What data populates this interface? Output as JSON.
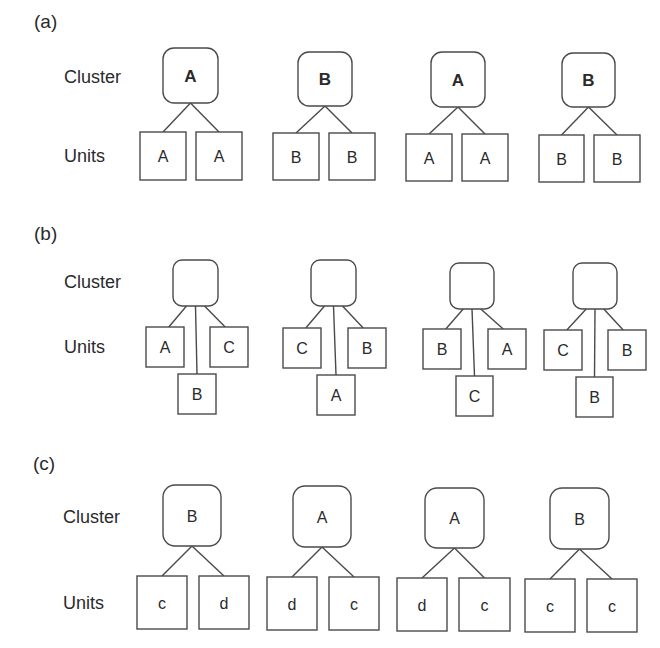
{
  "diagram": {
    "row_labels": {
      "cluster": "Cluster",
      "units": "Units"
    },
    "stroke_color": "#4a4a4a",
    "text_color": "#2a2a2a",
    "panels": [
      {
        "id": "a",
        "label": "(a)",
        "label_pos": [
          34,
          28
        ],
        "cluster_label_pos": [
          64,
          83
        ],
        "units_label_pos": [
          64,
          162
        ],
        "cluster_bold": true,
        "trees": [
          {
            "cluster": {
              "text": "A",
              "x": 163,
              "y": 48,
              "w": 55,
              "h": 55
            },
            "units": [
              {
                "text": "A",
                "x": 140,
                "y": 132,
                "w": 46,
                "h": 48
              },
              {
                "text": "A",
                "x": 196,
                "y": 132,
                "w": 46,
                "h": 48
              }
            ]
          },
          {
            "cluster": {
              "text": "B",
              "x": 298,
              "y": 52,
              "w": 54,
              "h": 54
            },
            "units": [
              {
                "text": "B",
                "x": 273,
                "y": 133,
                "w": 46,
                "h": 47
              },
              {
                "text": "B",
                "x": 329,
                "y": 133,
                "w": 46,
                "h": 47
              }
            ]
          },
          {
            "cluster": {
              "text": "A",
              "x": 431,
              "y": 52,
              "w": 54,
              "h": 55
            },
            "units": [
              {
                "text": "A",
                "x": 406,
                "y": 134,
                "w": 46,
                "h": 47
              },
              {
                "text": "A",
                "x": 462,
                "y": 134,
                "w": 46,
                "h": 47
              }
            ]
          },
          {
            "cluster": {
              "text": "B",
              "x": 562,
              "y": 53,
              "w": 53,
              "h": 54
            },
            "units": [
              {
                "text": "B",
                "x": 539,
                "y": 135,
                "w": 45,
                "h": 47
              },
              {
                "text": "B",
                "x": 594,
                "y": 135,
                "w": 46,
                "h": 47
              }
            ]
          }
        ]
      },
      {
        "id": "b",
        "label": "(b)",
        "label_pos": [
          34,
          240
        ],
        "cluster_label_pos": [
          64,
          288
        ],
        "units_label_pos": [
          64,
          353
        ],
        "cluster_bold": false,
        "trees": [
          {
            "cluster": {
              "text": "",
              "x": 173,
              "y": 260,
              "w": 45,
              "h": 46
            },
            "units": [
              {
                "text": "A",
                "x": 146,
                "y": 327,
                "w": 38,
                "h": 40,
                "pos": "left"
              },
              {
                "text": "C",
                "x": 210,
                "y": 327,
                "w": 38,
                "h": 40,
                "pos": "right"
              },
              {
                "text": "B",
                "x": 178,
                "y": 374,
                "w": 38,
                "h": 40,
                "pos": "bottom"
              }
            ]
          },
          {
            "cluster": {
              "text": "",
              "x": 311,
              "y": 260,
              "w": 45,
              "h": 46
            },
            "units": [
              {
                "text": "C",
                "x": 283,
                "y": 328,
                "w": 38,
                "h": 40,
                "pos": "left"
              },
              {
                "text": "B",
                "x": 348,
                "y": 328,
                "w": 38,
                "h": 40,
                "pos": "right"
              },
              {
                "text": "A",
                "x": 317,
                "y": 375,
                "w": 38,
                "h": 40,
                "pos": "bottom"
              }
            ]
          },
          {
            "cluster": {
              "text": "",
              "x": 450,
              "y": 263,
              "w": 44,
              "h": 46
            },
            "units": [
              {
                "text": "B",
                "x": 423,
                "y": 329,
                "w": 38,
                "h": 40,
                "pos": "left"
              },
              {
                "text": "A",
                "x": 488,
                "y": 329,
                "w": 38,
                "h": 40,
                "pos": "right"
              },
              {
                "text": "C",
                "x": 456,
                "y": 376,
                "w": 37,
                "h": 40,
                "pos": "bottom"
              }
            ]
          },
          {
            "cluster": {
              "text": "",
              "x": 573,
              "y": 263,
              "w": 44,
              "h": 46
            },
            "units": [
              {
                "text": "C",
                "x": 544,
                "y": 330,
                "w": 38,
                "h": 40,
                "pos": "left"
              },
              {
                "text": "B",
                "x": 608,
                "y": 330,
                "w": 38,
                "h": 40,
                "pos": "right"
              },
              {
                "text": "B",
                "x": 576,
                "y": 377,
                "w": 37,
                "h": 40,
                "pos": "bottom"
              }
            ]
          }
        ]
      },
      {
        "id": "c",
        "label": "(c)",
        "label_pos": [
          33,
          470
        ],
        "cluster_label_pos": [
          63,
          523
        ],
        "units_label_pos": [
          63,
          609
        ],
        "cluster_bold": false,
        "trees": [
          {
            "cluster": {
              "text": "B",
              "x": 163,
              "y": 485,
              "w": 58,
              "h": 61
            },
            "units": [
              {
                "text": "c",
                "x": 137,
                "y": 576,
                "w": 50,
                "h": 53
              },
              {
                "text": "d",
                "x": 199,
                "y": 576,
                "w": 50,
                "h": 53
              }
            ]
          },
          {
            "cluster": {
              "text": "A",
              "x": 293,
              "y": 486,
              "w": 58,
              "h": 61
            },
            "units": [
              {
                "text": "d",
                "x": 267,
                "y": 577,
                "w": 50,
                "h": 53
              },
              {
                "text": "c",
                "x": 329,
                "y": 577,
                "w": 50,
                "h": 53
              }
            ]
          },
          {
            "cluster": {
              "text": "A",
              "x": 425,
              "y": 488,
              "w": 59,
              "h": 60
            },
            "units": [
              {
                "text": "d",
                "x": 397,
                "y": 578,
                "w": 50,
                "h": 53
              },
              {
                "text": "c",
                "x": 459,
                "y": 578,
                "w": 51,
                "h": 53
              }
            ]
          },
          {
            "cluster": {
              "text": "B",
              "x": 550,
              "y": 488,
              "w": 59,
              "h": 61
            },
            "units": [
              {
                "text": "c",
                "x": 525,
                "y": 579,
                "w": 50,
                "h": 53
              },
              {
                "text": "c",
                "x": 587,
                "y": 579,
                "w": 50,
                "h": 53
              }
            ]
          }
        ]
      }
    ]
  }
}
